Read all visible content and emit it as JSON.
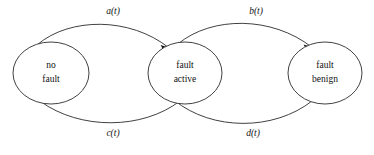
{
  "diagram": {
    "type": "state-transition-diagram",
    "background_color": "#ffffff",
    "stroke_color": "#2b2b2b",
    "text_color": "#111111",
    "states": [
      {
        "id": "no-fault",
        "line1": "no",
        "line2": "fault",
        "cx": 51,
        "cy": 73,
        "rx": 38,
        "ry": 31
      },
      {
        "id": "fault-active",
        "line1": "fault",
        "line2": "active",
        "cx": 185,
        "cy": 73,
        "rx": 37,
        "ry": 31
      },
      {
        "id": "fault-benign",
        "line1": "fault",
        "line2": "benign",
        "cx": 325,
        "cy": 73,
        "rx": 37,
        "ry": 31
      }
    ],
    "transitions": [
      {
        "id": "a-t",
        "label": "a(t)",
        "from": "no-fault",
        "to": "fault-active",
        "position": "top-left",
        "label_x": 113,
        "label_y": 12
      },
      {
        "id": "b-t",
        "label": "b(t)",
        "from": "fault-active",
        "to": "fault-benign",
        "position": "top-right",
        "label_x": 256,
        "label_y": 12
      },
      {
        "id": "c-t",
        "label": "c(t)",
        "from": "fault-active",
        "to": "no-fault",
        "position": "bottom-left",
        "label_x": 113,
        "label_y": 134
      },
      {
        "id": "d-t",
        "label": "d(t)",
        "from": "fault-benign",
        "to": "fault-active",
        "position": "bottom-right",
        "label_x": 253,
        "label_y": 134
      }
    ]
  }
}
